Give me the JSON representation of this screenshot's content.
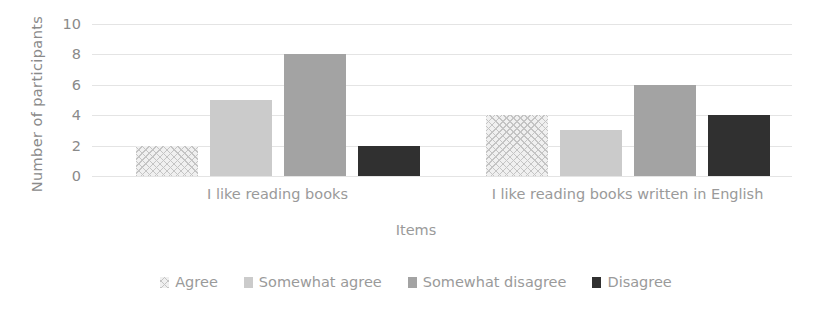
{
  "chart_data": {
    "type": "bar",
    "title": "",
    "xlabel": "Items",
    "ylabel": "Number of participants",
    "categories": [
      "I like reading books",
      "I like reading books written in English"
    ],
    "series": [
      {
        "name": "Agree",
        "values": [
          2,
          4
        ],
        "color": "#f0f0f0",
        "pattern": "checkered"
      },
      {
        "name": "Somewhat agree",
        "values": [
          5,
          3
        ],
        "color": "#cbcbcb",
        "pattern": "solid"
      },
      {
        "name": "Somewhat disagree",
        "values": [
          8,
          6
        ],
        "color": "#a3a3a3",
        "pattern": "solid"
      },
      {
        "name": "Disagree",
        "values": [
          2,
          4
        ],
        "color": "#303030",
        "pattern": "solid"
      }
    ],
    "ylim": [
      0,
      10
    ],
    "yticks": [
      0,
      2,
      4,
      6,
      8,
      10
    ],
    "ytick_labels": [
      "0",
      "2",
      "4",
      "6",
      "8",
      "10"
    ],
    "grid": true,
    "grid_axis": "y",
    "legend_position": "bottom",
    "gridline_color": "#e4e4e4",
    "text_color": "#8a8a8a",
    "background": "#ffffff"
  }
}
